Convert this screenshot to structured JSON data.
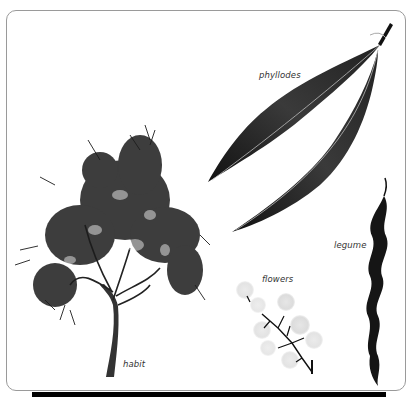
{
  "figure": {
    "labels": {
      "phyllodes": "phyllodes",
      "habit": "habit",
      "flowers": "flowers",
      "legume": "legume"
    },
    "colors": {
      "frame_border": "#9a9a9a",
      "ink": "#1a1a1a",
      "leaf": "#2b2b2b",
      "flower": "#d9d9d9",
      "bottom_bar": "#000000"
    }
  }
}
